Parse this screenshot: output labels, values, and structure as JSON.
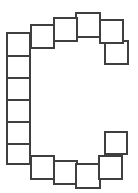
{
  "canvas": {
    "width": 138,
    "height": 193,
    "background": "#ffffff",
    "title": "Square Ring Diagram"
  },
  "style": {
    "fill": "#ffffff",
    "stroke": "#3f3f3f",
    "stroke_light": "#555555",
    "stroke_width": 2
  },
  "chart_data": {
    "type": "diagram",
    "shape": "open-ring",
    "opening_side": "right",
    "unit_shape": "square",
    "unit_count": 18,
    "nominal_size": 22,
    "squares": [
      {
        "id": "s01",
        "group": "left-column",
        "x": 6,
        "y": 32,
        "w": 25,
        "h": 25,
        "stroke": "#3f3f3f",
        "order": 1
      },
      {
        "id": "s02",
        "group": "left-column",
        "x": 6,
        "y": 55,
        "w": 25,
        "h": 24,
        "stroke": "#3f3f3f",
        "order": 2
      },
      {
        "id": "s03",
        "group": "left-column",
        "x": 6,
        "y": 77,
        "w": 25,
        "h": 24,
        "stroke": "#3f3f3f",
        "order": 3
      },
      {
        "id": "s04",
        "group": "left-column",
        "x": 6,
        "y": 99,
        "w": 25,
        "h": 24,
        "stroke": "#3f3f3f",
        "order": 4
      },
      {
        "id": "s05",
        "group": "left-column",
        "x": 6,
        "y": 121,
        "w": 25,
        "h": 24,
        "stroke": "#3f3f3f",
        "order": 5
      },
      {
        "id": "s06",
        "group": "left-column",
        "x": 6,
        "y": 143,
        "w": 25,
        "h": 22,
        "stroke": "#3f3f3f",
        "order": 6
      },
      {
        "id": "s07",
        "group": "bottom-row",
        "x": 30,
        "y": 155,
        "w": 25,
        "h": 25,
        "stroke": "#3f3f3f",
        "order": 7
      },
      {
        "id": "s08",
        "group": "bottom-row",
        "x": 53,
        "y": 160,
        "w": 25,
        "h": 25,
        "stroke": "#3f3f3f",
        "order": 8
      },
      {
        "id": "s09",
        "group": "bottom-row",
        "x": 75,
        "y": 163,
        "w": 26,
        "h": 26,
        "stroke": "#3f3f3f",
        "order": 9
      },
      {
        "id": "s10",
        "group": "bottom-row",
        "x": 98,
        "y": 155,
        "w": 25,
        "h": 25,
        "stroke": "#3f3f3f",
        "order": 10
      },
      {
        "id": "s11",
        "group": "right-bottom",
        "x": 104,
        "y": 131,
        "w": 24,
        "h": 24,
        "stroke": "#3f3f3f",
        "order": 11
      },
      {
        "id": "s12",
        "group": "right-top",
        "x": 104,
        "y": 40,
        "w": 25,
        "h": 25,
        "stroke": "#3f3f3f",
        "order": 12
      },
      {
        "id": "s13",
        "group": "top-row",
        "x": 99,
        "y": 19,
        "w": 25,
        "h": 25,
        "stroke": "#3f3f3f",
        "order": 13
      },
      {
        "id": "s14",
        "group": "top-row",
        "x": 75,
        "y": 12,
        "w": 26,
        "h": 26,
        "stroke": "#3f3f3f",
        "order": 14
      },
      {
        "id": "s15",
        "group": "top-row",
        "x": 53,
        "y": 17,
        "w": 25,
        "h": 25,
        "stroke": "#3f3f3f",
        "order": 15
      },
      {
        "id": "s16",
        "group": "top-row",
        "x": 30,
        "y": 24,
        "w": 25,
        "h": 25,
        "stroke": "#3f3f3f",
        "order": 16
      }
    ]
  }
}
